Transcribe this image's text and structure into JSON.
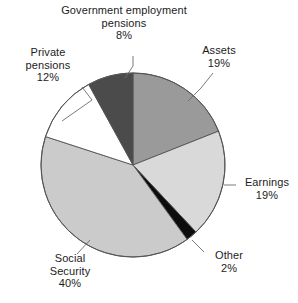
{
  "chart_data": {
    "type": "pie",
    "title": "",
    "subtitle": "",
    "categories": [
      "Assets",
      "Earnings",
      "Other",
      "Social Security",
      "Private pensions",
      "Government employment pensions"
    ],
    "values": [
      19,
      19,
      2,
      40,
      12,
      8
    ],
    "value_labels": [
      "19%",
      "19%",
      "2%",
      "40%",
      "12%",
      "8%"
    ],
    "unit": "%",
    "total": 100,
    "start_angle_deg": 0,
    "direction": "clockwise",
    "legend": "none",
    "labels_position": "outside-with-leader-lines",
    "grid": false,
    "slices": [
      {
        "name": "Assets",
        "value": 19,
        "value_label": "19%",
        "color": "#9a9a9a",
        "start_deg": 0,
        "end_deg": 68.4
      },
      {
        "name": "Earnings",
        "value": 19,
        "value_label": "19%",
        "color": "#d9d9d9",
        "start_deg": 68.4,
        "end_deg": 136.8
      },
      {
        "name": "Other",
        "value": 2,
        "value_label": "2%",
        "color": "#0d0d0d",
        "start_deg": 136.8,
        "end_deg": 144.0
      },
      {
        "name": "Social Security",
        "value": 40,
        "value_label": "40%",
        "color": "#cbcbcb",
        "start_deg": 144.0,
        "end_deg": 288.0
      },
      {
        "name": "Private pensions",
        "value": 12,
        "value_label": "12%",
        "color": "#ffffff",
        "start_deg": 288.0,
        "end_deg": 331.2
      },
      {
        "name": "Government employment pensions",
        "value": 8,
        "value_label": "8%",
        "color": "#4b4b4b",
        "start_deg": 331.2,
        "end_deg": 360.0
      }
    ]
  },
  "labels": {
    "govt_pensions": {
      "line1": "Government employment",
      "line2": "pensions",
      "line3": "8%"
    },
    "private_pensions": {
      "line1": "Private",
      "line2": "pensions",
      "line3": "12%"
    },
    "assets": {
      "line1": "Assets",
      "line2": "19%"
    },
    "earnings": {
      "line1": "Earnings",
      "line2": "19%"
    },
    "other": {
      "line1": "Other",
      "line2": "2%"
    },
    "social_security": {
      "line1": "Social",
      "line2": "Security",
      "line3": "40%"
    }
  },
  "style": {
    "background": "#ffffff",
    "outline": "#555555",
    "text": "#1c1c1c",
    "leader_line": "#6b6b6b"
  }
}
